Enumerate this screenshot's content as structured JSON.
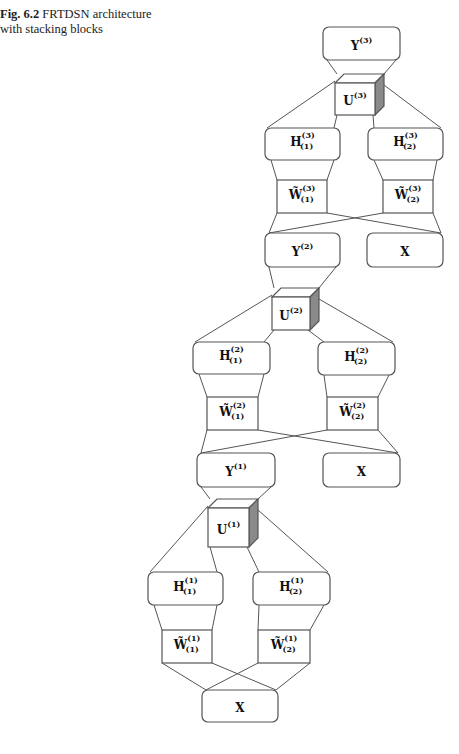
{
  "caption": {
    "label": "Fig. 6.2",
    "text": "FRTDSN architecture with stacking blocks"
  },
  "diagram": {
    "title": "FRTDSN architecture with stacking blocks",
    "nodes": [
      {
        "id": "Y3",
        "base": "Y",
        "sup": "(3)",
        "sub": ""
      },
      {
        "id": "U3",
        "base": "U",
        "sup": "(3)",
        "sub": ""
      },
      {
        "id": "H3_1",
        "base": "H",
        "sup": "(3)",
        "sub": "(1)"
      },
      {
        "id": "H3_2",
        "base": "H",
        "sup": "(3)",
        "sub": "(2)"
      },
      {
        "id": "W3_1",
        "base": "W̃",
        "sup": "(3)",
        "sub": "(1)"
      },
      {
        "id": "W3_2",
        "base": "W̃",
        "sup": "(3)",
        "sub": "(2)"
      },
      {
        "id": "Y2",
        "base": "Y",
        "sup": "(2)",
        "sub": ""
      },
      {
        "id": "X_3",
        "base": "X",
        "sup": "",
        "sub": ""
      },
      {
        "id": "U2",
        "base": "U",
        "sup": "(2)",
        "sub": ""
      },
      {
        "id": "H2_1",
        "base": "H",
        "sup": "(2)",
        "sub": "(1)"
      },
      {
        "id": "H2_2",
        "base": "H",
        "sup": "(2)",
        "sub": "(2)"
      },
      {
        "id": "W2_1",
        "base": "W̃",
        "sup": "(2)",
        "sub": "(1)"
      },
      {
        "id": "W2_2",
        "base": "W̃",
        "sup": "(2)",
        "sub": "(2)"
      },
      {
        "id": "Y1",
        "base": "Y",
        "sup": "(1)",
        "sub": ""
      },
      {
        "id": "X_2",
        "base": "X",
        "sup": "",
        "sub": ""
      },
      {
        "id": "U1",
        "base": "U",
        "sup": "(1)",
        "sub": ""
      },
      {
        "id": "H1_1",
        "base": "H",
        "sup": "(1)",
        "sub": "(1)"
      },
      {
        "id": "H1_2",
        "base": "H",
        "sup": "(1)",
        "sub": "(2)"
      },
      {
        "id": "W1_1",
        "base": "W̃",
        "sup": "(1)",
        "sub": "(1)"
      },
      {
        "id": "W1_2",
        "base": "W̃",
        "sup": "(1)",
        "sub": "(2)"
      },
      {
        "id": "X_1",
        "base": "X",
        "sup": "",
        "sub": ""
      }
    ],
    "colors": {
      "stroke": "#555555",
      "cube_side": "#8a8a8a",
      "text": "#111111"
    }
  }
}
